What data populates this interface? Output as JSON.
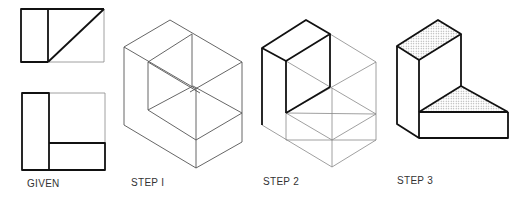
{
  "diagram": {
    "panels": [
      {
        "id": "given",
        "label": "GIVEN"
      },
      {
        "id": "step1",
        "label": "STEP I"
      },
      {
        "id": "step2",
        "label": "STEP 2"
      },
      {
        "id": "step3",
        "label": "STEP 3"
      }
    ],
    "colors": {
      "line": "#111111",
      "construction": "#888888",
      "shade": "#cfcfcf"
    }
  }
}
